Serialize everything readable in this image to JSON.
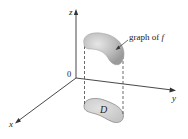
{
  "diagram": {
    "type": "3d-surface-over-domain",
    "axes": {
      "x_label": "x",
      "y_label": "y",
      "z_label": "z",
      "origin_label": "0"
    },
    "surface": {
      "label_prefix": "graph of ",
      "label_function": "f"
    },
    "domain": {
      "label": "D"
    },
    "colors": {
      "axis": "#333333",
      "surface_fill": "#b9b9b9",
      "surface_highlight": "#e4e4e4",
      "domain_fill": "#cfcfcf",
      "domain_stroke": "#8a8a8a",
      "dashed": "#444444"
    }
  }
}
